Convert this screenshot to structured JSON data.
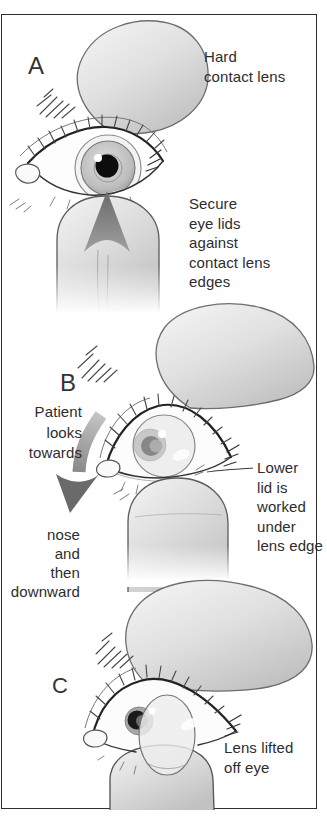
{
  "figure": {
    "panel_a": {
      "letter": "A",
      "hard_contact_lens_label": [
        "Hard",
        "contact lens"
      ],
      "secure_eyelids_label": [
        "Secure",
        "eye lids",
        "against",
        "contact lens",
        "edges"
      ]
    },
    "panel_b": {
      "letter": "B",
      "patient_looks_label": [
        "Patient",
        "looks",
        "towards"
      ],
      "nose_downward_label": [
        "nose",
        "and",
        "then",
        "downward"
      ],
      "lower_lid_label": [
        "Lower",
        "lid is",
        "worked",
        "under",
        "lens edge"
      ]
    },
    "panel_c": {
      "letter": "C",
      "lens_lifted_label": [
        "Lens lifted",
        "off eye"
      ]
    },
    "colors": {
      "background": "#ffffff",
      "border": "#2e2e2e",
      "text": "#2d2d2d",
      "line_art_outline": "#4a4a4a",
      "skin_light": "#f2f2f2",
      "skin_shadow": "#bfbfbf",
      "arrow_gray": "#6e6e6e",
      "pupil_black": "#111111"
    }
  }
}
